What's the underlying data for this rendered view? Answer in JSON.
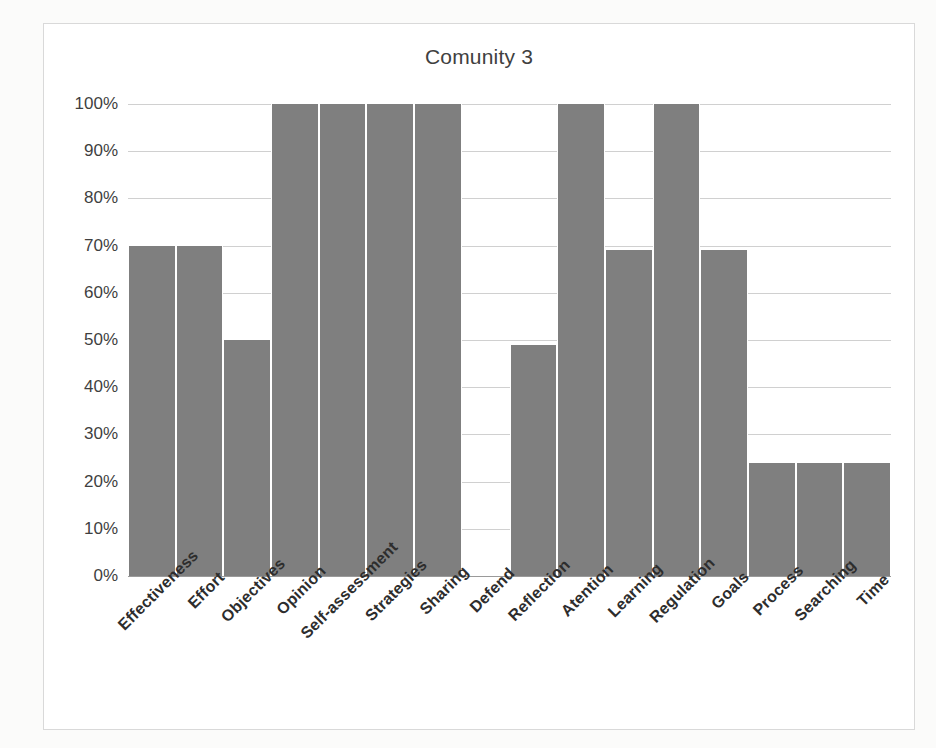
{
  "chart_data": {
    "type": "bar",
    "title": "Comunity 3",
    "xlabel": "",
    "ylabel": "",
    "ylim": [
      0,
      100
    ],
    "ytick_labels": [
      "100%",
      "90%",
      "80%",
      "70%",
      "60%",
      "50%",
      "40%",
      "30%",
      "20%",
      "10%",
      "0%"
    ],
    "ytick_values": [
      100,
      90,
      80,
      70,
      60,
      50,
      40,
      30,
      20,
      10,
      0
    ],
    "grid": true,
    "legend": "none",
    "bar_color": "#7f7f7f",
    "categories": [
      "Effectiveness",
      "Effort",
      "Objectives",
      "Opinion",
      "Self-assessment",
      "Strategies",
      "Sharing",
      "Defend",
      "Reflection",
      "Atention",
      "Learning",
      "Regulation",
      "Goals",
      "Process",
      "Searching",
      "Time"
    ],
    "values": [
      70,
      70,
      50,
      100,
      100,
      100,
      100,
      0,
      49,
      100,
      69,
      100,
      69,
      24,
      24,
      24
    ]
  },
  "ghost_text": {
    "top_right": "",
    "mid_left": "",
    "bottom": ""
  }
}
